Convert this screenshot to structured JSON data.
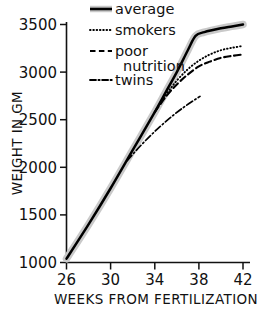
{
  "chart_data": {
    "type": "line",
    "title": "",
    "xlabel": "WEEKS FROM FERTILIZATION",
    "ylabel": "WEIGHT IN GM",
    "xlim": [
      26,
      42
    ],
    "ylim": [
      1000,
      3500
    ],
    "xticks": [
      26,
      30,
      34,
      38,
      42
    ],
    "yticks": [
      1000,
      1500,
      2000,
      2500,
      3000,
      3500
    ],
    "xtick_labels": [
      "26",
      "30",
      "34",
      "38",
      "42"
    ],
    "ytick_labels": [
      "1000",
      "1500",
      "2000",
      "2500",
      "3000",
      "3500"
    ],
    "grid": false,
    "legend_position": "top-left",
    "series": [
      {
        "name": "average",
        "style": "solid-thick-halo",
        "color": "#000000",
        "halo_color": "#c9c9c9",
        "x": [
          26,
          28,
          30,
          32,
          34,
          35,
          36,
          37,
          37.7,
          38.5,
          40,
          41,
          42
        ],
        "values": [
          1040,
          1400,
          1780,
          2180,
          2580,
          2790,
          3000,
          3230,
          3380,
          3420,
          3460,
          3480,
          3500
        ]
      },
      {
        "name": "smokers",
        "style": "dotted",
        "color": "#000000",
        "x": [
          34,
          35,
          36,
          37,
          38,
          39,
          40,
          41,
          42
        ],
        "values": [
          2580,
          2760,
          2910,
          3030,
          3120,
          3185,
          3230,
          3255,
          3275
        ]
      },
      {
        "name": "poor nutrition",
        "style": "dashed",
        "color": "#000000",
        "x": [
          34,
          35,
          36,
          37,
          38,
          39,
          40,
          41,
          42
        ],
        "values": [
          2580,
          2740,
          2870,
          2975,
          3060,
          3110,
          3150,
          3170,
          3185
        ]
      },
      {
        "name": "twins",
        "style": "dash-dot",
        "color": "#000000",
        "x": [
          31.5,
          32.5,
          33.5,
          34.5,
          35.5,
          36.5,
          37.5,
          38.1
        ],
        "values": [
          2070,
          2200,
          2320,
          2430,
          2530,
          2620,
          2700,
          2745
        ]
      }
    ]
  },
  "legend": {
    "items": [
      {
        "label": "average",
        "swatch": "solid-thick-halo"
      },
      {
        "label": "smokers",
        "swatch": "dotted"
      },
      {
        "label": "poor",
        "label2": "nutrition",
        "swatch": "dashed"
      },
      {
        "label": "twins",
        "swatch": "dash-dot"
      }
    ]
  },
  "axes": {
    "y_title": "WEIGHT IN GM",
    "x_title": "WEEKS FROM FERTILIZATION",
    "y_tick_0": "1000",
    "y_tick_1": "1500",
    "y_tick_2": "2000",
    "y_tick_3": "2500",
    "y_tick_4": "3000",
    "y_tick_5": "3500",
    "x_tick_0": "26",
    "x_tick_1": "30",
    "x_tick_2": "34",
    "x_tick_3": "38",
    "x_tick_4": "42"
  },
  "colors": {
    "line": "#000000",
    "halo": "#c9c9c9",
    "axis": "#111111",
    "background": "#ffffff"
  }
}
